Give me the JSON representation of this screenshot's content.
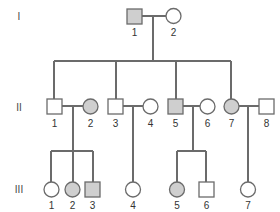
{
  "diagram": {
    "type": "pedigree",
    "colors": {
      "line": "#6b6b6b",
      "affected_fill": "#cfcfcf",
      "unaffected_fill": "#ffffff",
      "text": "#333333"
    },
    "generations": [
      {
        "label": "I",
        "y": 16
      },
      {
        "label": "II",
        "y": 107
      },
      {
        "label": "III",
        "y": 189
      }
    ],
    "individuals": {
      "I": [
        {
          "id": "1",
          "sex": "male",
          "affected": true
        },
        {
          "id": "2",
          "sex": "female",
          "affected": false
        }
      ],
      "II": [
        {
          "id": "1",
          "sex": "male",
          "affected": false
        },
        {
          "id": "2",
          "sex": "female",
          "affected": true
        },
        {
          "id": "3",
          "sex": "male",
          "affected": false
        },
        {
          "id": "4",
          "sex": "female",
          "affected": false
        },
        {
          "id": "5",
          "sex": "male",
          "affected": true
        },
        {
          "id": "6",
          "sex": "female",
          "affected": false
        },
        {
          "id": "7",
          "sex": "female",
          "affected": true
        },
        {
          "id": "8",
          "sex": "male",
          "affected": false
        }
      ],
      "III": [
        {
          "id": "1",
          "sex": "female",
          "affected": false
        },
        {
          "id": "2",
          "sex": "female",
          "affected": true
        },
        {
          "id": "3",
          "sex": "male",
          "affected": true
        },
        {
          "id": "4",
          "sex": "female",
          "affected": false
        },
        {
          "id": "5",
          "sex": "female",
          "affected": true
        },
        {
          "id": "6",
          "sex": "male",
          "affected": false
        },
        {
          "id": "7",
          "sex": "female",
          "affected": false
        }
      ]
    },
    "couples": [
      {
        "generation": "I",
        "partners": [
          "1",
          "2"
        ],
        "children_generation": "II",
        "children": [
          "1",
          "3",
          "5",
          "7"
        ]
      },
      {
        "generation": "II",
        "partners": [
          "1",
          "2"
        ],
        "children_generation": "III",
        "children": [
          "1",
          "2",
          "3"
        ]
      },
      {
        "generation": "II",
        "partners": [
          "3",
          "4"
        ],
        "children_generation": "III",
        "children": [
          "4"
        ]
      },
      {
        "generation": "II",
        "partners": [
          "5",
          "6"
        ],
        "children_generation": "III",
        "children": [
          "5",
          "6"
        ]
      },
      {
        "generation": "II",
        "partners": [
          "7",
          "8"
        ],
        "children_generation": "III",
        "children": [
          "7"
        ]
      }
    ]
  }
}
